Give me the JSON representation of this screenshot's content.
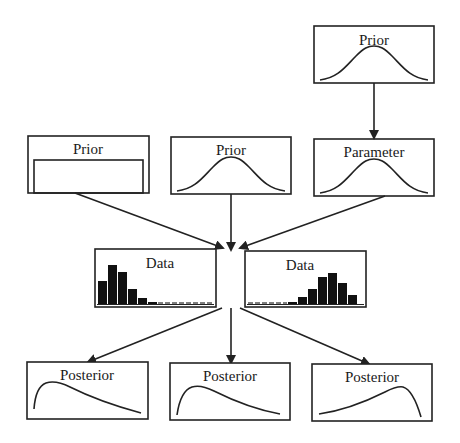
{
  "diagram": {
    "colors": {
      "stroke": "#222222",
      "bars": "#111111",
      "background": "#ffffff"
    },
    "nodes": {
      "hyper_prior": {
        "label": "Prior",
        "shape": "bell-curve"
      },
      "prior_uniform": {
        "label": "Prior",
        "shape": "uniform"
      },
      "prior_normal": {
        "label": "Prior",
        "shape": "bell-curve"
      },
      "parameter": {
        "label": "Parameter",
        "shape": "bell-curve"
      },
      "data_left": {
        "label": "Data",
        "shape": "histogram-right-skewed"
      },
      "data_right": {
        "label": "Data",
        "shape": "histogram-left-skewed"
      },
      "posterior_left": {
        "label": "Posterior",
        "shape": "right-skewed-curve"
      },
      "posterior_center": {
        "label": "Posterior",
        "shape": "right-skewed-curve"
      },
      "posterior_right": {
        "label": "Posterior",
        "shape": "left-skewed-curve"
      }
    },
    "edges": [
      {
        "from": "hyper_prior",
        "to": "parameter"
      },
      {
        "from": "prior_uniform",
        "to": "data"
      },
      {
        "from": "prior_normal",
        "to": "data"
      },
      {
        "from": "parameter",
        "to": "data"
      },
      {
        "from": "data",
        "to": "posterior_left"
      },
      {
        "from": "data",
        "to": "posterior_center"
      },
      {
        "from": "data",
        "to": "posterior_right"
      }
    ]
  }
}
